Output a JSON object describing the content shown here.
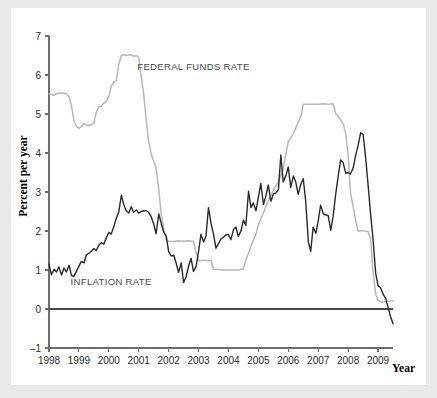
{
  "chart_data": {
    "type": "line",
    "title": "",
    "xlabel": "Year",
    "ylabel": "Percent per year",
    "xlim": [
      1998,
      2009.5
    ],
    "ylim": [
      -1,
      7
    ],
    "yticks": [
      -1,
      0,
      1,
      2,
      3,
      4,
      5,
      6,
      7
    ],
    "ytick_labels": [
      "–1",
      "0",
      "1",
      "2",
      "3",
      "4",
      "5",
      "6",
      "7"
    ],
    "xticks": [
      1998,
      1999,
      2000,
      2001,
      2002,
      2003,
      2004,
      2005,
      2006,
      2007,
      2008,
      2009
    ],
    "xtick_labels": [
      "1998",
      "1999",
      "2000",
      "2001",
      "2002",
      "2003",
      "2004",
      "2005",
      "2006",
      "2007",
      "2008",
      "2009"
    ],
    "grid": false,
    "legend_position": "inline-annotation",
    "colors": {
      "federal_funds_rate": "#b8b8b8",
      "inflation_rate": "#2a2a2a",
      "axis": "#6d6d6d",
      "zero_line": "#4a4a4a",
      "background": "#ffffff",
      "page_background": "#e9e9e9"
    },
    "annotations": [
      {
        "text": "FEDERAL FUNDS RATE",
        "x": 2000.95,
        "y": 6.12
      },
      {
        "text": "INFLATION RATE",
        "x": 1998.72,
        "y": 0.62
      }
    ],
    "series": [
      {
        "name": "FEDERAL FUNDS RATE",
        "color": "#b8b8b8",
        "x": [
          1998.0,
          1998.08,
          1998.17,
          1998.25,
          1998.33,
          1998.42,
          1998.5,
          1998.58,
          1998.67,
          1998.75,
          1998.83,
          1998.92,
          1999.0,
          1999.08,
          1999.17,
          1999.25,
          1999.33,
          1999.42,
          1999.5,
          1999.58,
          1999.67,
          1999.75,
          1999.83,
          1999.92,
          2000.0,
          2000.08,
          2000.17,
          2000.25,
          2000.33,
          2000.42,
          2000.5,
          2000.58,
          2000.67,
          2000.75,
          2000.83,
          2000.92,
          2001.0,
          2001.08,
          2001.17,
          2001.25,
          2001.33,
          2001.42,
          2001.5,
          2001.58,
          2001.67,
          2001.75,
          2001.83,
          2001.92,
          2002.0,
          2002.17,
          2002.33,
          2002.5,
          2002.67,
          2002.83,
          2002.92,
          2003.0,
          2003.17,
          2003.33,
          2003.42,
          2003.5,
          2003.67,
          2003.83,
          2004.0,
          2004.17,
          2004.33,
          2004.5,
          2004.58,
          2004.67,
          2004.75,
          2004.83,
          2004.92,
          2005.0,
          2005.17,
          2005.33,
          2005.5,
          2005.67,
          2005.83,
          2005.92,
          2006.0,
          2006.17,
          2006.33,
          2006.42,
          2006.5,
          2006.67,
          2006.83,
          2006.92,
          2007.0,
          2007.17,
          2007.33,
          2007.5,
          2007.58,
          2007.67,
          2007.83,
          2007.92,
          2008.0,
          2008.08,
          2008.17,
          2008.25,
          2008.33,
          2008.5,
          2008.67,
          2008.75,
          2008.83,
          2008.92,
          2009.0,
          2009.08,
          2009.17,
          2009.33,
          2009.5
        ],
        "values": [
          5.52,
          5.5,
          5.48,
          5.52,
          5.54,
          5.53,
          5.53,
          5.52,
          5.45,
          5.22,
          4.84,
          4.68,
          4.63,
          4.68,
          4.76,
          4.72,
          4.7,
          4.73,
          4.77,
          5.05,
          5.18,
          5.2,
          5.28,
          5.33,
          5.45,
          5.71,
          5.82,
          5.85,
          6.27,
          6.5,
          6.52,
          6.5,
          6.51,
          6.52,
          6.48,
          6.5,
          6.45,
          5.98,
          5.48,
          4.85,
          4.29,
          3.97,
          3.78,
          3.62,
          3.06,
          2.44,
          2.07,
          1.78,
          1.74,
          1.73,
          1.75,
          1.74,
          1.75,
          1.74,
          1.44,
          1.24,
          1.25,
          1.24,
          1.25,
          1.02,
          1.01,
          1.0,
          1.0,
          1.0,
          1.0,
          1.03,
          1.26,
          1.43,
          1.61,
          1.76,
          1.93,
          2.16,
          2.47,
          2.78,
          3.04,
          3.26,
          3.58,
          3.98,
          4.29,
          4.49,
          4.79,
          4.94,
          5.25,
          5.25,
          5.25,
          5.25,
          5.25,
          5.26,
          5.25,
          5.26,
          5.02,
          4.94,
          4.76,
          4.49,
          3.94,
          2.98,
          2.61,
          2.28,
          2.0,
          2.01,
          1.98,
          1.81,
          0.97,
          0.39,
          0.22,
          0.18,
          0.18,
          0.2,
          0.21
        ]
      },
      {
        "name": "INFLATION RATE",
        "color": "#2a2a2a",
        "x": [
          1998.0,
          1998.08,
          1998.17,
          1998.25,
          1998.33,
          1998.42,
          1998.5,
          1998.58,
          1998.67,
          1998.75,
          1998.83,
          1998.92,
          1999.0,
          1999.08,
          1999.17,
          1999.25,
          1999.33,
          1999.42,
          1999.5,
          1999.58,
          1999.67,
          1999.75,
          1999.83,
          1999.92,
          2000.0,
          2000.08,
          2000.17,
          2000.25,
          2000.33,
          2000.42,
          2000.5,
          2000.58,
          2000.67,
          2000.75,
          2000.83,
          2000.92,
          2001.0,
          2001.08,
          2001.17,
          2001.25,
          2001.33,
          2001.42,
          2001.5,
          2001.58,
          2001.67,
          2001.75,
          2001.83,
          2001.92,
          2002.0,
          2002.08,
          2002.17,
          2002.25,
          2002.33,
          2002.42,
          2002.5,
          2002.58,
          2002.67,
          2002.75,
          2002.83,
          2002.92,
          2003.0,
          2003.08,
          2003.17,
          2003.25,
          2003.33,
          2003.42,
          2003.5,
          2003.58,
          2003.67,
          2003.75,
          2003.83,
          2003.92,
          2004.0,
          2004.08,
          2004.17,
          2004.25,
          2004.33,
          2004.42,
          2004.5,
          2004.58,
          2004.67,
          2004.75,
          2004.83,
          2004.92,
          2005.0,
          2005.08,
          2005.17,
          2005.25,
          2005.33,
          2005.42,
          2005.5,
          2005.58,
          2005.67,
          2005.75,
          2005.83,
          2005.92,
          2006.0,
          2006.08,
          2006.17,
          2006.25,
          2006.33,
          2006.42,
          2006.5,
          2006.58,
          2006.67,
          2006.75,
          2006.83,
          2006.92,
          2007.0,
          2007.08,
          2007.17,
          2007.25,
          2007.33,
          2007.42,
          2007.5,
          2007.58,
          2007.67,
          2007.75,
          2007.83,
          2007.92,
          2008.0,
          2008.08,
          2008.17,
          2008.25,
          2008.33,
          2008.42,
          2008.5,
          2008.58,
          2008.67,
          2008.75,
          2008.83,
          2008.92,
          2009.0,
          2009.08,
          2009.17,
          2009.25,
          2009.33,
          2009.42,
          2009.5
        ],
        "values": [
          1.15,
          0.88,
          1.02,
          0.95,
          1.08,
          0.87,
          1.05,
          0.95,
          1.12,
          0.86,
          0.83,
          0.97,
          1.1,
          1.22,
          1.18,
          1.39,
          1.43,
          1.48,
          1.55,
          1.5,
          1.64,
          1.7,
          1.66,
          1.83,
          1.97,
          1.92,
          2.12,
          2.32,
          2.48,
          2.92,
          2.68,
          2.52,
          2.46,
          2.62,
          2.48,
          2.54,
          2.46,
          2.5,
          2.52,
          2.52,
          2.48,
          2.36,
          2.18,
          1.93,
          2.44,
          2.2,
          1.98,
          1.87,
          1.47,
          1.36,
          1.38,
          1.18,
          0.94,
          1.18,
          0.68,
          0.82,
          1.11,
          1.3,
          0.96,
          1.1,
          1.48,
          1.92,
          1.72,
          1.88,
          2.6,
          2.18,
          1.92,
          1.56,
          1.68,
          1.8,
          1.84,
          1.9,
          1.91,
          1.78,
          2.04,
          2.1,
          1.86,
          2.01,
          2.28,
          2.14,
          3.02,
          2.6,
          2.72,
          2.52,
          2.86,
          3.22,
          2.68,
          2.9,
          3.18,
          2.76,
          2.95,
          2.97,
          3.06,
          3.95,
          3.26,
          3.42,
          3.64,
          3.12,
          3.41,
          3.25,
          2.94,
          3.2,
          3.34,
          2.78,
          1.72,
          1.48,
          2.1,
          1.94,
          2.26,
          2.66,
          2.44,
          2.41,
          2.4,
          2.02,
          2.38,
          2.92,
          3.42,
          3.82,
          3.76,
          3.48,
          3.5,
          3.46,
          3.62,
          3.94,
          4.18,
          4.52,
          4.48,
          3.92,
          3.16,
          2.44,
          1.82,
          0.92,
          0.6,
          0.55,
          0.38,
          0.28,
          0.06,
          -0.2,
          -0.38
        ]
      }
    ]
  },
  "axes": {
    "ylabel": "Percent per year",
    "xlabel": "Year"
  }
}
